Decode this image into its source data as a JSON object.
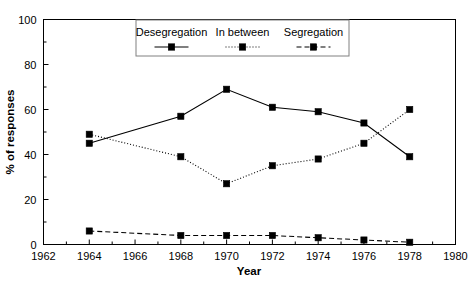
{
  "chart_data": {
    "type": "line",
    "title": "",
    "xlabel": "Year",
    "ylabel": "% of responses",
    "xlim": [
      1962,
      1980
    ],
    "ylim": [
      0,
      100
    ],
    "grid": false,
    "legend_position": "top-center",
    "x": [
      1964,
      1968,
      1970,
      1972,
      1974,
      1976,
      1978
    ],
    "xticks": [
      1962,
      1964,
      1966,
      1968,
      1970,
      1972,
      1974,
      1976,
      1978,
      1980
    ],
    "xtick_labels": [
      "1962",
      "1964",
      "1966",
      "1968",
      "1970",
      "1972",
      "1974",
      "1976",
      "1978",
      "1980"
    ],
    "xminor_ticks": [
      1963,
      1965,
      1967,
      1969,
      1971,
      1973,
      1975,
      1977,
      1979
    ],
    "yticks": [
      0,
      20,
      40,
      60,
      80,
      100
    ],
    "ytick_labels": [
      "0",
      "20",
      "40",
      "60",
      "80",
      "100"
    ],
    "yminor_ticks": [
      10,
      30,
      50,
      70,
      90
    ],
    "series": [
      {
        "name": "Desegregation",
        "style": "solid",
        "marker": "square",
        "color": "#000000",
        "values": [
          45,
          57,
          69,
          61,
          59,
          54,
          39
        ]
      },
      {
        "name": "In between",
        "style": "dotted",
        "marker": "square",
        "color": "#000000",
        "values": [
          49,
          39,
          27,
          35,
          38,
          45,
          60
        ]
      },
      {
        "name": "Segregation",
        "style": "dashed",
        "marker": "square",
        "color": "#000000",
        "values": [
          6,
          4,
          4,
          4,
          3,
          2,
          1
        ]
      }
    ]
  },
  "legend": {
    "entries": [
      {
        "label": "Desegregation"
      },
      {
        "label": "In between"
      },
      {
        "label": "Segregation"
      }
    ]
  },
  "axes": {
    "x_title": "Year",
    "y_title": "% of responses"
  }
}
